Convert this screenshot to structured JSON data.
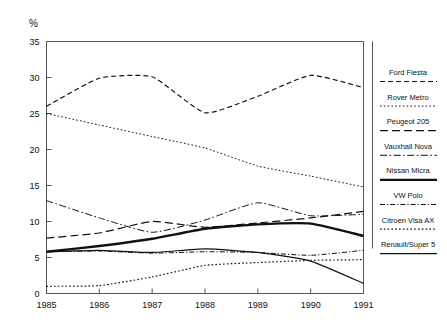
{
  "chart_data": {
    "type": "line",
    "title": "",
    "xlabel": "",
    "ylabel": "%",
    "categories": [
      "1985",
      "1986",
      "1987",
      "1988",
      "1989",
      "1990",
      "1991"
    ],
    "x": [
      1985,
      1986,
      1987,
      1988,
      1989,
      1990,
      1991
    ],
    "ylim": [
      0,
      35
    ],
    "yticks": [
      "0",
      "5",
      "10",
      "15",
      "20",
      "25",
      "30",
      "35"
    ],
    "ytick_values": [
      0,
      5,
      10,
      15,
      20,
      25,
      30,
      35
    ],
    "grid": false,
    "legend_position": "right",
    "series": [
      {
        "name": "Ford Fiesta",
        "values": [
          26.0,
          29.9,
          30.1,
          25.1,
          27.4,
          30.3,
          28.6
        ],
        "style": "dashed",
        "width": 1.2
      },
      {
        "name": "Rover Metro",
        "values": [
          25.0,
          23.4,
          21.8,
          20.2,
          17.7,
          16.3,
          14.8
        ],
        "style": "dotted",
        "width": 1.0
      },
      {
        "name": "Peugeot 205",
        "values": [
          7.7,
          8.4,
          10.0,
          9.2,
          9.8,
          10.5,
          11.4
        ],
        "style": "dashed-long",
        "width": 1.2
      },
      {
        "name": "Vauxhall Nova",
        "values": [
          12.9,
          10.5,
          8.5,
          10.2,
          12.6,
          10.8,
          11.0
        ],
        "style": "dash-dot",
        "width": 1.0
      },
      {
        "name": "Nissan Micra",
        "values": [
          5.8,
          6.6,
          7.6,
          9.0,
          9.6,
          9.7,
          8.0
        ],
        "style": "solid-thick",
        "width": 2.4
      },
      {
        "name": "VW Polo",
        "values": [
          5.8,
          5.9,
          5.6,
          5.8,
          5.7,
          5.3,
          6.0
        ],
        "style": "dash-dot-fine",
        "width": 1.0
      },
      {
        "name": "Citroen Visa AX",
        "values": [
          1.0,
          1.1,
          2.3,
          3.9,
          4.3,
          4.6,
          4.7
        ],
        "style": "dotted",
        "width": 1.2
      },
      {
        "name": "Renault/Super 5",
        "values": [
          5.8,
          6.0,
          5.7,
          6.2,
          5.7,
          4.5,
          1.4
        ],
        "style": "solid-thin",
        "width": 1.2
      }
    ]
  },
  "axes": {
    "y_unit_label": "%",
    "y_tick_labels": [
      "35",
      "30",
      "25",
      "20",
      "15",
      "10",
      "5",
      "0"
    ],
    "x_tick_labels": [
      "1985",
      "1986",
      "1987",
      "1988",
      "1989",
      "1990",
      "1991"
    ]
  },
  "legend": {
    "items": [
      {
        "label": "Ford Fiesta",
        "style": "dashed"
      },
      {
        "label": "Rover Metro",
        "style": "dotted"
      },
      {
        "label": "Peugeot 205",
        "style": "dashed-long"
      },
      {
        "label": "Vauxhall Nova",
        "style": "dash-dot"
      },
      {
        "label": "Nissan Micra",
        "style": "solid-thick"
      },
      {
        "label": "VW Polo",
        "style": "dash-dot-fine"
      },
      {
        "label": "Citroen Visa AX",
        "style": "dotted"
      },
      {
        "label": "Renault/Super 5",
        "style": "solid-thin"
      }
    ]
  },
  "colors": {
    "line": "#111111",
    "axis": "#555555",
    "background": "#ffffff"
  }
}
